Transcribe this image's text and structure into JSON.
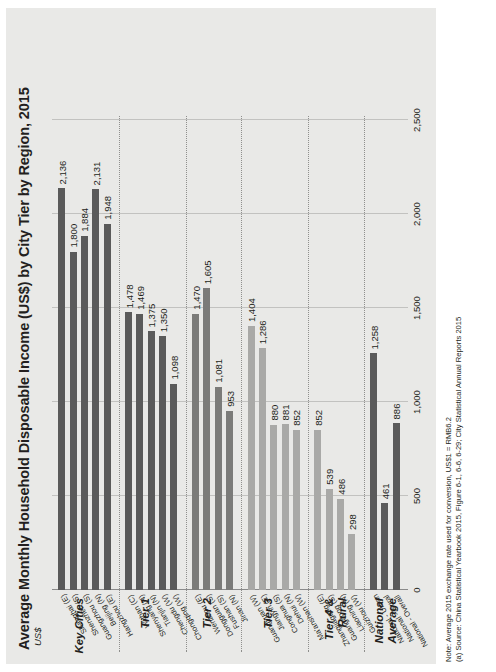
{
  "chart_data": {
    "type": "bar",
    "orientation": "horizontal",
    "title": "Average Monthly Household Disposable Income (US$) by City Tier by Region, 2015",
    "xlabel": "US$",
    "ylabel": "",
    "xlim": [
      0,
      2500
    ],
    "ticks": [
      "0",
      "500",
      "1,000",
      "1,500",
      "2,000",
      "2,500"
    ],
    "tick_values": [
      0,
      500,
      1000,
      1500,
      2000,
      2500
    ],
    "grid": true,
    "legend_position": "none",
    "groups": [
      {
        "label": "Key Cities",
        "color": "#5a5a5a",
        "categories": [
          "Shanghai (E)",
          "Shenzhen (S)",
          "Guangzhou (S)",
          "Beijing (N)",
          "Hangzhou (E)"
        ],
        "values": [
          2136,
          1800,
          1884,
          2131,
          1948
        ],
        "labels": [
          "2,136",
          "1,800",
          "1,884",
          "2,131",
          "1,948"
        ]
      },
      {
        "label": "Tier 1",
        "color": "#5a5a5a",
        "categories": [
          "Wuhan (C)",
          "Shenyang (N)",
          "Tianjin (N)",
          "Chengdu (W)",
          "Chongqing (W)"
        ],
        "values": [
          1478,
          1469,
          1375,
          1350,
          1098
        ],
        "labels": [
          "1,478",
          "1,469",
          "1,375",
          "1,350",
          "1,098"
        ]
      },
      {
        "label": "Tier 2",
        "color": "#7b7b79",
        "categories": [
          "Wenzhou (E)",
          "Dongguan (S)",
          "Fushan (S)",
          "Jinan (N)"
        ],
        "values": [
          1470,
          1605,
          1081,
          953
        ],
        "labels": [
          "1,470",
          "1,605",
          "1,081",
          "953"
        ]
      },
      {
        "label": "Tier 3",
        "color": "#a9a9a7",
        "categories": [
          "Guangyuan (W)",
          "Jiangyin (E)",
          "Conghua (S)",
          "Dehui (N)",
          "Ma'anshan (W)"
        ],
        "values": [
          1404,
          1286,
          880,
          881,
          852
        ],
        "labels": [
          "1,404",
          "1,286",
          "880",
          "881",
          "852"
        ]
      },
      {
        "label": "Tier 4 & Rural",
        "color": "#a9a9a7",
        "categories": [
          "Zhangjiagang (E)",
          "Guangdong (S)",
          "Liaoning (N)",
          "Guizhou (W)"
        ],
        "values": [
          852,
          539,
          486,
          298
        ],
        "labels": [
          "852",
          "539",
          "486",
          "298"
        ]
      },
      {
        "label": "National Average",
        "color": "#5a5a5a",
        "categories": [
          "National - Urban",
          "National - Rural",
          "National - Overall"
        ],
        "values": [
          1258,
          461,
          886
        ],
        "labels": [
          "1,258",
          "461",
          "886"
        ]
      }
    ]
  },
  "notes": {
    "line1": "Note: Average 2015 exchange rate used for conversion, US$1 = RMB6.2",
    "line2": "(a) Source: China Statistical Yearbook 2015, Figure 6-1, 6-6, 6-29; City Statistical Annual Reports 2015"
  }
}
